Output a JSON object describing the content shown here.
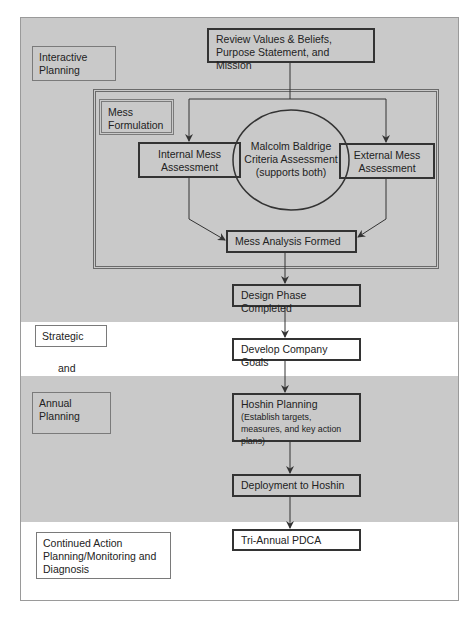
{
  "diagram": {
    "phase_labels": {
      "interactive_planning": "Interactive Planning",
      "mess_formulation": "Mess Formulation",
      "strategic": "Strategic",
      "and": "and",
      "annual_planning": "Annual Planning",
      "continued": "Continued Action Planning/Monitoring and Diagnosis"
    },
    "nodes": {
      "review": "Review Values & Beliefs, Purpose Statement, and Mission",
      "internal": "Internal Mess Assessment",
      "baldrige": "Malcolm Baldrige Criteria Assessment (supports both)",
      "external": "External Mess Assessment",
      "mess_analysis": "Mess Analysis Formed",
      "design_phase": "Design Phase Completed",
      "company_goals": "Develop Company Goals",
      "hoshin_title": "Hoshin Planning",
      "hoshin_sub": "(Establish targets, measures, and key action plans)",
      "deployment": "Deployment to Hoshin",
      "pdca": "Tri-Annual PDCA"
    },
    "colors": {
      "band_gray": "#c9c9c9",
      "band_white": "#ffffff",
      "line": "#333333"
    }
  }
}
